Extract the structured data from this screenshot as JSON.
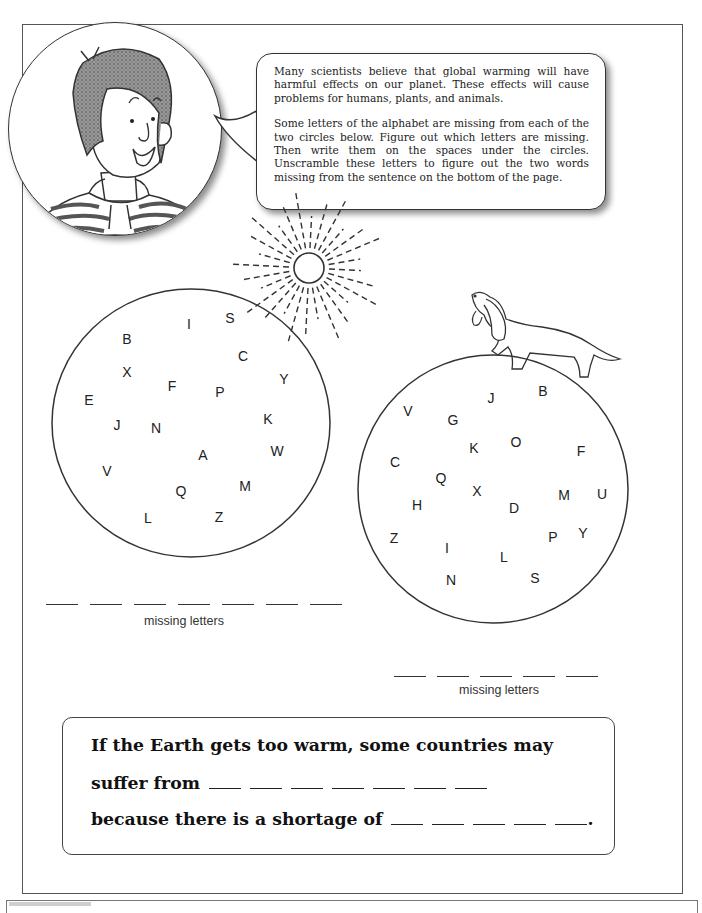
{
  "speech_bubble": {
    "paragraph_1": "Many scientists believe that global warming will have harmful effects on our planet. These effects will cause problems for humans, plants, and animals.",
    "paragraph_2": "Some letters of the alphabet are missing from each of the two circles below. Figure out which letters are missing. Then write them on the spaces under the circles. Unscramble these letters to figure out the two words missing from the sentence on the bottom of the page."
  },
  "illustrations": {
    "avatar": "smiling-boy-striped-hoodie",
    "sun": "sun-icon",
    "dog": "dog-walking-on-globe"
  },
  "left_circle": {
    "letters": [
      {
        "char": "B",
        "x": 127,
        "y": 339
      },
      {
        "char": "I",
        "x": 189,
        "y": 324
      },
      {
        "char": "S",
        "x": 230,
        "y": 318
      },
      {
        "char": "C",
        "x": 243,
        "y": 356
      },
      {
        "char": "X",
        "x": 127,
        "y": 372
      },
      {
        "char": "F",
        "x": 172,
        "y": 386
      },
      {
        "char": "Y",
        "x": 284,
        "y": 379
      },
      {
        "char": "P",
        "x": 220,
        "y": 392
      },
      {
        "char": "E",
        "x": 89,
        "y": 400
      },
      {
        "char": "J",
        "x": 117,
        "y": 425
      },
      {
        "char": "N",
        "x": 156,
        "y": 428
      },
      {
        "char": "K",
        "x": 268,
        "y": 419
      },
      {
        "char": "W",
        "x": 277,
        "y": 451
      },
      {
        "char": "A",
        "x": 203,
        "y": 455
      },
      {
        "char": "V",
        "x": 107,
        "y": 471
      },
      {
        "char": "Q",
        "x": 181,
        "y": 491
      },
      {
        "char": "M",
        "x": 245,
        "y": 486
      },
      {
        "char": "L",
        "x": 148,
        "y": 518
      },
      {
        "char": "Z",
        "x": 219,
        "y": 517
      }
    ],
    "blank_count": 7,
    "caption": "missing letters"
  },
  "right_circle": {
    "letters": [
      {
        "char": "V",
        "x": 408,
        "y": 411
      },
      {
        "char": "J",
        "x": 491,
        "y": 398
      },
      {
        "char": "B",
        "x": 543,
        "y": 391
      },
      {
        "char": "G",
        "x": 453,
        "y": 420
      },
      {
        "char": "K",
        "x": 474,
        "y": 448
      },
      {
        "char": "O",
        "x": 516,
        "y": 442
      },
      {
        "char": "F",
        "x": 581,
        "y": 451
      },
      {
        "char": "C",
        "x": 395,
        "y": 462
      },
      {
        "char": "Q",
        "x": 441,
        "y": 478
      },
      {
        "char": "X",
        "x": 477,
        "y": 491
      },
      {
        "char": "M",
        "x": 564,
        "y": 495
      },
      {
        "char": "U",
        "x": 602,
        "y": 494
      },
      {
        "char": "H",
        "x": 417,
        "y": 505
      },
      {
        "char": "D",
        "x": 514,
        "y": 508
      },
      {
        "char": "Z",
        "x": 394,
        "y": 538
      },
      {
        "char": "P",
        "x": 553,
        "y": 537
      },
      {
        "char": "Y",
        "x": 583,
        "y": 533
      },
      {
        "char": "I",
        "x": 447,
        "y": 548
      },
      {
        "char": "L",
        "x": 504,
        "y": 557
      },
      {
        "char": "N",
        "x": 451,
        "y": 580
      },
      {
        "char": "S",
        "x": 535,
        "y": 578
      }
    ],
    "blank_count": 5,
    "caption": "missing letters"
  },
  "answer_box": {
    "line_1": "If the Earth gets too warm, some countries may",
    "line_2_prefix": "suffer from",
    "line_2_blanks": 7,
    "line_3_prefix": "because there is a shortage of",
    "line_3_blanks": 5,
    "line_3_suffix": "."
  }
}
